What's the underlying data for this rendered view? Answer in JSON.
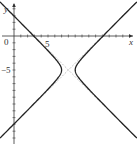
{
  "chart_data": {
    "type": "line",
    "title": "",
    "xlabel": "x",
    "ylabel": "y",
    "xlim": [
      -2,
      18
    ],
    "ylim": [
      -16,
      5
    ],
    "tick_labels": {
      "origin": "0",
      "x": [
        "5"
      ],
      "y": [
        "-5"
      ]
    },
    "x_ticks": [
      1,
      2,
      3,
      4,
      5,
      6,
      7,
      8,
      9,
      10,
      11,
      12,
      13,
      14,
      15,
      16,
      17
    ],
    "y_ticks": [
      -15,
      -14,
      -13,
      -12,
      -11,
      -10,
      -9,
      -8,
      -7,
      -6,
      -5,
      -4,
      -3,
      -2,
      -1,
      1,
      2,
      3,
      4
    ],
    "series": [
      {
        "name": "hyperbola",
        "equation": "(x-8)^2 - (y+5)^2 = 1",
        "center": [
          8,
          -5
        ],
        "a": 1,
        "b": 1,
        "style": "solid"
      },
      {
        "name": "asymptote 1",
        "equation": "y + 5 = x - 8",
        "style": "dashed"
      },
      {
        "name": "asymptote 2",
        "equation": "y + 5 = -(x - 8)",
        "style": "dashed"
      }
    ],
    "grid": false,
    "legend": "none"
  },
  "labels": {
    "x_axis": "x",
    "y_axis": "y",
    "origin": "0",
    "x_tick_5": "5",
    "y_tick_neg5": "−5"
  },
  "colors": {
    "curve": "#222222",
    "asymptote": "#aaaaaa",
    "axis": "#333333"
  }
}
